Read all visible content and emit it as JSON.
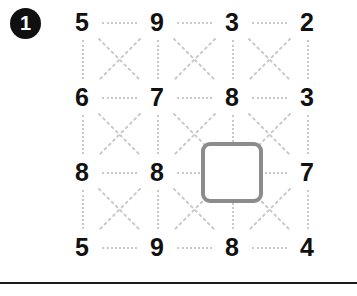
{
  "worksheet": {
    "exercise_number": "1",
    "badge_color": "#101010",
    "badge_text_color": "#ffffff",
    "connector_color": "#c9c9c9",
    "digit_color": "#111111",
    "answer_box_border_color": "#8c8c8c",
    "divider_color": "#1a1a1a"
  },
  "grid": {
    "rows": 4,
    "columns": 4,
    "cells": [
      [
        {
          "value": "5",
          "type": "digit"
        },
        {
          "value": "9",
          "type": "digit"
        },
        {
          "value": "3",
          "type": "digit"
        },
        {
          "value": "2",
          "type": "digit"
        }
      ],
      [
        {
          "value": "6",
          "type": "digit"
        },
        {
          "value": "7",
          "type": "digit"
        },
        {
          "value": "8",
          "type": "digit"
        },
        {
          "value": "3",
          "type": "digit"
        }
      ],
      [
        {
          "value": "8",
          "type": "digit"
        },
        {
          "value": "8",
          "type": "digit"
        },
        {
          "value": "",
          "type": "answer-box"
        },
        {
          "value": "7",
          "type": "digit"
        }
      ],
      [
        {
          "value": "5",
          "type": "digit"
        },
        {
          "value": "9",
          "type": "digit"
        },
        {
          "value": "8",
          "type": "digit"
        },
        {
          "value": "4",
          "type": "digit"
        }
      ]
    ]
  }
}
